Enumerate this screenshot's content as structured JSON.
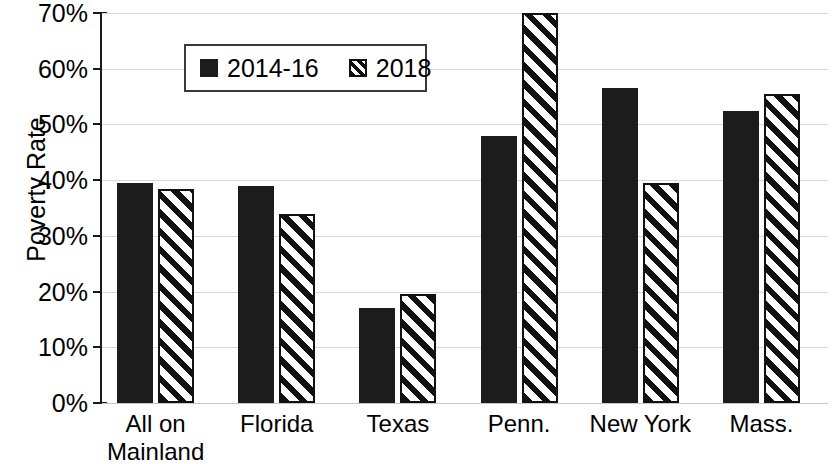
{
  "chart_data": {
    "type": "bar",
    "title": "",
    "xlabel": "",
    "ylabel": "Poverty Rate",
    "ylim": [
      0,
      70
    ],
    "ytick_values": [
      0,
      10,
      20,
      30,
      40,
      50,
      60,
      70
    ],
    "ytick_labels": [
      "0%",
      "10%",
      "20%",
      "30%",
      "40%",
      "50%",
      "60%",
      "70%"
    ],
    "grid": true,
    "legend_position": "upper-left-inside",
    "categories": [
      "All on Mainland",
      "Florida",
      "Texas",
      "Penn.",
      "New York",
      "Mass."
    ],
    "category_lines": [
      [
        "All on",
        "Mainland"
      ],
      [
        "Florida"
      ],
      [
        "Texas"
      ],
      [
        "Penn."
      ],
      [
        "New York"
      ],
      [
        "Mass."
      ]
    ],
    "series": [
      {
        "name": "2014-16",
        "fill": "solid",
        "color": "#1c1c1c",
        "values": [
          39.5,
          39.0,
          17.0,
          48.0,
          56.5,
          52.5
        ]
      },
      {
        "name": "2018",
        "fill": "diagonal-hatch",
        "color": "#111111",
        "values": [
          38.5,
          34.0,
          19.5,
          70.0,
          39.5,
          55.5
        ]
      }
    ]
  },
  "legend": {
    "entries": [
      {
        "label": "2014-16",
        "swatch": "solid-square-icon"
      },
      {
        "label": "2018",
        "swatch": "hatched-square-icon"
      }
    ]
  },
  "axis": {
    "y_title": "Poverty Rate"
  }
}
